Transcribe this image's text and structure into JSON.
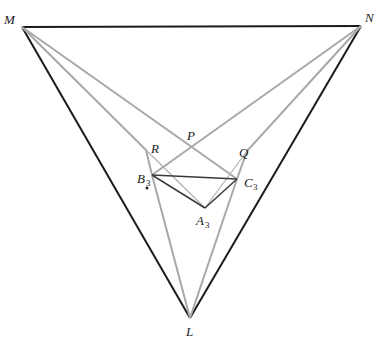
{
  "diagram": {
    "title": "",
    "colors": {
      "outer_triangle": "#1a1a1a",
      "gray_lines": "#a0a0a0",
      "inner_triangle": "#3a3a3a",
      "labels": "#222222"
    },
    "points": {
      "M": {
        "x": 22,
        "y": 27,
        "label": "M"
      },
      "N": {
        "x": 361,
        "y": 26,
        "label": "N"
      },
      "L": {
        "x": 190,
        "y": 318,
        "label": "L"
      },
      "P": {
        "x": 192,
        "y": 145,
        "label": "P"
      },
      "Q": {
        "x": 247,
        "y": 151,
        "label": "Q"
      },
      "R": {
        "x": 146,
        "y": 150,
        "label": "R"
      },
      "A3": {
        "x": 205,
        "y": 208,
        "label": "A",
        "sub": "3"
      },
      "B3": {
        "x": 152,
        "y": 175,
        "label": "B",
        "sub": "3"
      },
      "C3": {
        "x": 237,
        "y": 179,
        "label": "C",
        "sub": "3"
      }
    },
    "labels": {
      "M": "M",
      "N": "N",
      "L": "L",
      "P": "P",
      "Q": "Q",
      "R": "R",
      "A": "A",
      "B": "B",
      "C": "C",
      "sub3": "3"
    }
  }
}
